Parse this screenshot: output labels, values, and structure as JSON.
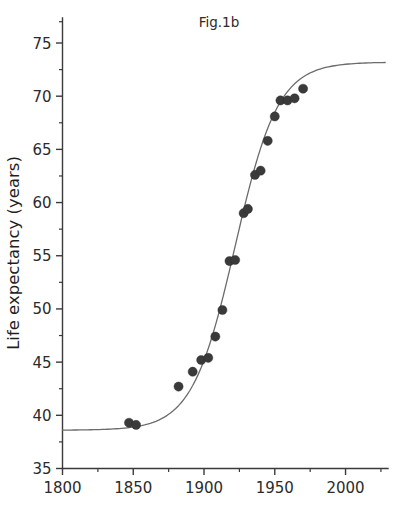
{
  "figure": {
    "title": "Fig.1b",
    "background_color": "#ffffff",
    "point_color": "#3a3a3a",
    "curve_color": "#6b6b6b",
    "axis_color": "#3a3a3a"
  },
  "chart_data": {
    "type": "scatter",
    "title": "Fig.1b",
    "xlabel": "",
    "ylabel": "Life expectancy (years)",
    "xlim": [
      1800,
      2030
    ],
    "ylim": [
      35,
      77
    ],
    "grid": false,
    "legend": "none",
    "x_ticks_major": [
      1800,
      1850,
      1900,
      1950,
      2000
    ],
    "x_tick_labels": [
      "1800",
      "1850",
      "1900",
      "1950",
      "2000"
    ],
    "x_ticks_minor": [
      1825,
      1875,
      1925,
      1975,
      2025
    ],
    "y_ticks_major": [
      35,
      40,
      45,
      50,
      55,
      60,
      65,
      70,
      75
    ],
    "y_tick_labels": [
      "35",
      "40",
      "45",
      "50",
      "55",
      "60",
      "65",
      "70",
      "75"
    ],
    "y_ticks_minor": [
      37.5,
      42.5,
      47.5,
      52.5,
      57.5,
      62.5,
      67.5,
      72.5,
      77
    ],
    "series": [
      {
        "name": "Observed life expectancy",
        "marker": "filled-circle",
        "points": [
          {
            "x": 1847,
            "y": 39.3
          },
          {
            "x": 1852,
            "y": 39.1
          },
          {
            "x": 1882,
            "y": 42.7
          },
          {
            "x": 1892,
            "y": 44.1
          },
          {
            "x": 1898,
            "y": 45.2
          },
          {
            "x": 1903,
            "y": 45.4
          },
          {
            "x": 1908,
            "y": 47.4
          },
          {
            "x": 1913,
            "y": 49.9
          },
          {
            "x": 1918,
            "y": 54.5
          },
          {
            "x": 1922,
            "y": 54.6
          },
          {
            "x": 1928,
            "y": 59.0
          },
          {
            "x": 1931,
            "y": 59.4
          },
          {
            "x": 1936,
            "y": 62.6
          },
          {
            "x": 1940,
            "y": 63.0
          },
          {
            "x": 1945,
            "y": 65.8
          },
          {
            "x": 1950,
            "y": 68.1
          },
          {
            "x": 1954,
            "y": 69.6
          },
          {
            "x": 1959,
            "y": 69.6
          },
          {
            "x": 1964,
            "y": 69.8
          },
          {
            "x": 1970,
            "y": 70.7
          }
        ]
      },
      {
        "name": "Logistic fit curve",
        "marker": "none",
        "model": "logistic",
        "asymptote_low": 38.6,
        "asymptote_high": 73.2,
        "midpoint_year": 1922,
        "growth_rate": 0.066,
        "x_range": [
          1800,
          2028
        ]
      }
    ]
  }
}
